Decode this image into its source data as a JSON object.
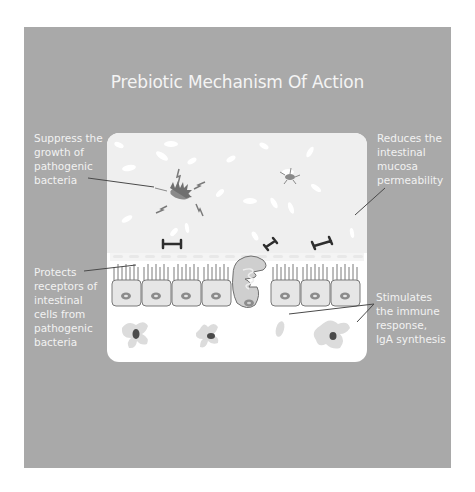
{
  "title": "Prebiotic Mechanism Of Action",
  "labels": {
    "top_left": "Suppress the\ngrowth of\npathogenic\nbacteria",
    "top_right": "Reduces the\nintestinal\nmucosa\npermeability",
    "bottom_left": "Protects\nreceptors of\nintestinal\ncells from\npathogenic\nbacteria",
    "bottom_right": "Stimulates\nthe immune\nresponse,\nIgA synthesis"
  },
  "colors": {
    "panel": "#a9a9a9",
    "lumen": "#efefef",
    "cell_fill": "#e6e6e6",
    "cell_stroke": "#7a7a7a",
    "text": "#f2f2f2",
    "leader_line": "#4a4a4a"
  },
  "diagram": {
    "epithelial_cells_left": 4,
    "goblet_cells": 1,
    "epithelial_cells_right": 3,
    "immune_cells": 3
  }
}
